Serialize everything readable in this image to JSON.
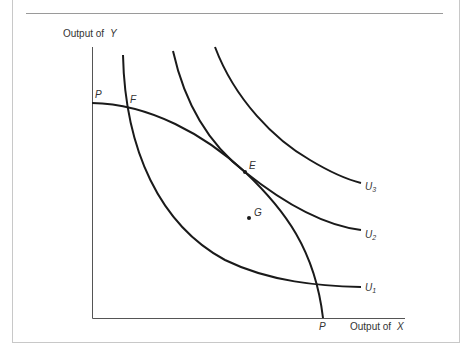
{
  "figure": {
    "y_axis_label_prefix": "Output of",
    "y_axis_label_var": "Y",
    "x_axis_label_prefix": "Output of",
    "x_axis_label_var": "X",
    "ppf_label_top": "P",
    "ppf_label_bottom": "P",
    "point_F": "F",
    "point_E": "E",
    "point_G": "G",
    "curve_labels": {
      "U1": "U",
      "U1_sub": "1",
      "U2": "U",
      "U2_sub": "2",
      "U3": "U",
      "U3_sub": "3"
    },
    "line_color": "#1a1a1a",
    "border_color": "#c8c8c8"
  }
}
